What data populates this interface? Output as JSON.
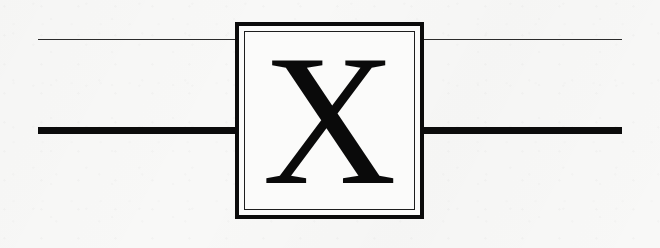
{
  "figure": {
    "kind": "quantum-circuit-diagram",
    "background_color": "#f8f8f7",
    "ink_color": "#0b0b0b"
  },
  "circuit": {
    "gate": {
      "label": "X",
      "name": "pauli-x-gate",
      "box": {
        "x": 235,
        "y": 22,
        "width": 189,
        "height": 197,
        "outer_border_width": 4.6,
        "inner_border_width": 1.5,
        "border_color": "#0b0b0b",
        "fill_color": "#fbfbfa"
      }
    },
    "wires": [
      {
        "name": "upper-wire",
        "style": "thin",
        "y": 39,
        "x_start": 38,
        "x_end": 622,
        "thickness": 1.4,
        "color": "#2b2b2b"
      },
      {
        "name": "lower-wire",
        "style": "thick",
        "y": 130,
        "x_start": 38,
        "x_end": 622,
        "thickness": 7.2,
        "color": "#0b0b0b"
      }
    ]
  }
}
